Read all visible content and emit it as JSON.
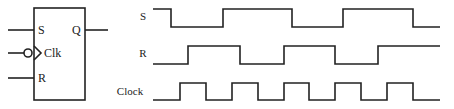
{
  "flipflop": {
    "inputs": {
      "s": "S",
      "clk": "Clk",
      "r": "R"
    },
    "output": {
      "q": "Q"
    },
    "clock_inverted": true
  },
  "timing": {
    "signals": [
      {
        "label": "S",
        "start_level": 1,
        "transitions_x": [
          171,
          223,
          292,
          343,
          413
        ]
      },
      {
        "label": "R",
        "start_level": 0,
        "transitions_x": [
          188,
          240,
          284,
          335,
          378
        ]
      },
      {
        "label": "Clock",
        "start_level": 0,
        "transitions_x": [
          180,
          206,
          232,
          258,
          284,
          309,
          335,
          361,
          387,
          413
        ]
      }
    ],
    "x_start": 153,
    "x_end": 440
  },
  "colors": {
    "line": "#222222",
    "background": "#ffffff"
  }
}
